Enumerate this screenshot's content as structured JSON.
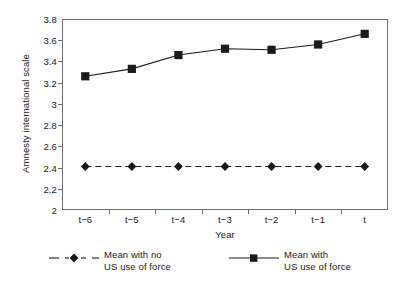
{
  "chart_data": {
    "type": "line",
    "title": "",
    "xlabel": "Year",
    "ylabel": "Amnesty international scale",
    "categories": [
      "t−6",
      "t−5",
      "t−4",
      "t−3",
      "t−2",
      "t−1",
      "t"
    ],
    "ylim": [
      2,
      3.8
    ],
    "yticks": [
      2,
      2.2,
      2.4,
      2.6,
      2.8,
      3,
      3.2,
      3.4,
      3.6,
      3.8
    ],
    "ytick_labels": [
      "2",
      "2.2",
      "2.4",
      "2.6",
      "2.8",
      "3",
      "3.2",
      "3.4",
      "3.6",
      "3.8"
    ],
    "grid": false,
    "legend_position": "below",
    "series": [
      {
        "name": "Mean with no\nUS use of force",
        "marker": "diamond",
        "linestyle": "dashed",
        "color": "#1a1a1a",
        "values": [
          2.41,
          2.41,
          2.41,
          2.41,
          2.41,
          2.41,
          2.41
        ]
      },
      {
        "name": "Mean with\nUS use of force",
        "marker": "square",
        "linestyle": "solid",
        "color": "#1a1a1a",
        "values": [
          3.26,
          3.33,
          3.46,
          3.52,
          3.51,
          3.56,
          3.66
        ]
      }
    ]
  },
  "legend": {
    "entries": [
      {
        "label": "Mean with no\nUS use of force",
        "marker": "diamond",
        "linestyle": "dashed"
      },
      {
        "label": "Mean with\nUS use of force",
        "marker": "square",
        "linestyle": "solid"
      }
    ]
  }
}
